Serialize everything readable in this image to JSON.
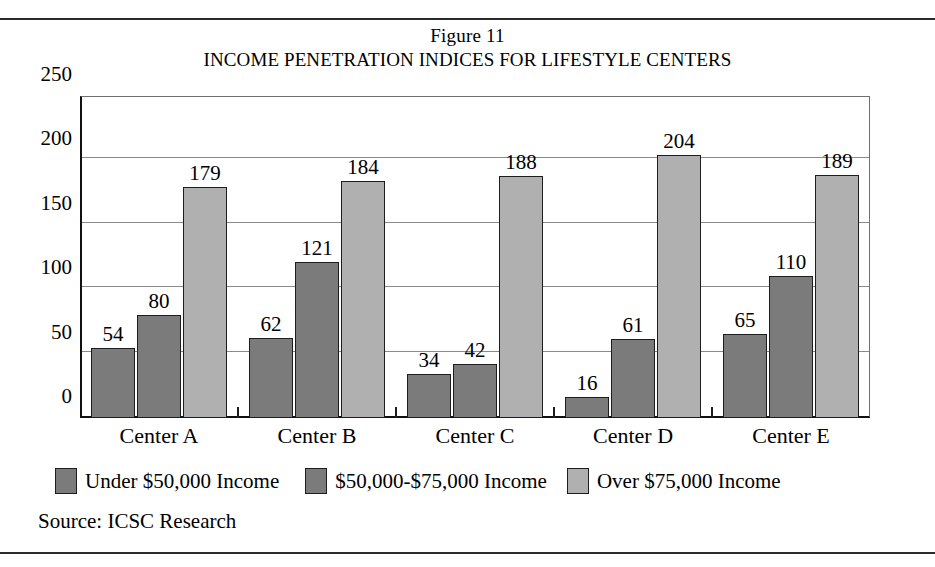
{
  "figure": {
    "number_label": "Figure 11",
    "title": "INCOME PENETRATION INDICES FOR LIFESTYLE CENTERS",
    "source": "Source: ICSC Research"
  },
  "colors": {
    "series_1": "#7b7b7b",
    "series_2": "#7b7b7b",
    "series_3": "#b0b0b0",
    "axis": "#1d1d1d",
    "gridline": "#8a8a8a",
    "rule": "#2b2b2b"
  },
  "chart_data": {
    "type": "bar",
    "title": "INCOME PENETRATION INDICES FOR LIFESTYLE CENTERS",
    "subtitle": "Figure 11",
    "xlabel": "",
    "ylabel": "",
    "ylim": [
      0,
      250
    ],
    "yticks": [
      0,
      50,
      100,
      150,
      200,
      250
    ],
    "ytick_labels": [
      "0",
      "50",
      "100",
      "150",
      "200",
      "250"
    ],
    "grid": true,
    "legend_position": "bottom",
    "data_labels": true,
    "categories": [
      "Center A",
      "Center B",
      "Center C",
      "Center D",
      "Center E"
    ],
    "series": [
      {
        "name": "Under $50,000 Income",
        "values": [
          54,
          62,
          34,
          16,
          65
        ],
        "color": "#7b7b7b"
      },
      {
        "name": "$50,000-$75,000 Income",
        "values": [
          80,
          121,
          42,
          61,
          110
        ],
        "color": "#7b7b7b"
      },
      {
        "name": "Over $75,000 Income",
        "values": [
          179,
          184,
          188,
          204,
          189
        ],
        "color": "#b0b0b0"
      }
    ]
  }
}
